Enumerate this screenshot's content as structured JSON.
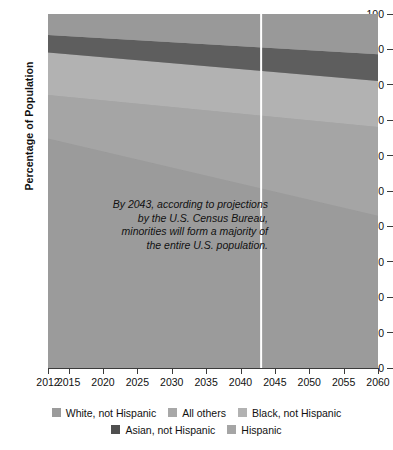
{
  "chart_data": {
    "type": "area",
    "title": "",
    "subtitle": "",
    "xlabel": "",
    "ylabel": "Percentage of Population",
    "xlim": [
      2012,
      2060
    ],
    "ylim": [
      0,
      100
    ],
    "grid": false,
    "stacked": true,
    "legend_position": "bottom",
    "x": [
      2012,
      2060
    ],
    "xtick_labels": [
      "2012",
      "2015",
      "2020",
      "2025",
      "2030",
      "2035",
      "2040",
      "2045",
      "2050",
      "2055",
      "2060"
    ],
    "xtick_values": [
      2012,
      2015,
      2020,
      2025,
      2030,
      2035,
      2040,
      2045,
      2050,
      2055,
      2060
    ],
    "ytick_labels": [
      "0",
      "10",
      "20",
      "30",
      "40",
      "50",
      "60",
      "70",
      "80",
      "90",
      "100"
    ],
    "ytick_values": [
      0,
      10,
      20,
      30,
      40,
      50,
      60,
      70,
      80,
      90,
      100
    ],
    "series": [
      {
        "name": "White, not Hispanic",
        "color": "#9b9b9b",
        "values": [
          64.8,
          43.0
        ]
      },
      {
        "name": "Hispanic",
        "color": "#a5a5a5",
        "values": [
          12.3,
          25.1
        ]
      },
      {
        "name": "Black, not Hispanic",
        "color": "#b2b2b2",
        "values": [
          12.0,
          13.0
        ]
      },
      {
        "name": "Asian, not Hispanic",
        "color": "#5e5e5e",
        "values": [
          5.0,
          7.5
        ]
      },
      {
        "name": "All others",
        "color": "#999999",
        "values": [
          5.9,
          11.4
        ]
      }
    ],
    "annotations": [
      {
        "name": "census-projection-note",
        "lines": [
          "By 2043, according to projections",
          "by the U.S. Census Bureau,",
          "minorities will form a majority of",
          "the entire U.S. population."
        ]
      }
    ],
    "reference_line": {
      "name": "year-2043-marker",
      "x": 2043,
      "color": "#ffffff",
      "label": "2043"
    }
  },
  "legend": {
    "rows": [
      [
        {
          "label": "White, not Hispanic",
          "color": "#9b9b9b"
        },
        {
          "label": "All others",
          "color": "#a8a8a8"
        },
        {
          "label": "Black, not Hispanic",
          "color": "#b2b2b2"
        }
      ],
      [
        {
          "label": "Asian, not Hispanic",
          "color": "#4f4f4f"
        },
        {
          "label": "Hispanic",
          "color": "#a5a5a5"
        }
      ]
    ]
  },
  "colors": {
    "plot_background": "#9b9b9b",
    "axis": "#3b3b3b",
    "text": "#111111",
    "reference_line": "#ffffff",
    "page_background": "#ffffff"
  }
}
